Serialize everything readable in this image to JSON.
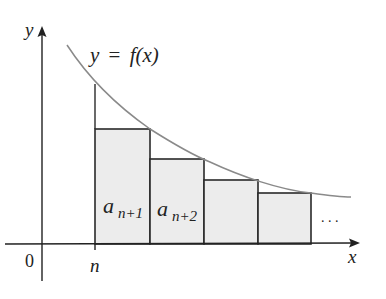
{
  "diagram": {
    "type": "riemann-rectangles-integral-test",
    "labels": {
      "y_axis": "y",
      "x_axis": "x",
      "origin": "0",
      "n_tick": "n",
      "curve_lhs": "y",
      "curve_eq": "=",
      "curve_rhs": "f(x)",
      "ellipsis": ". . ."
    },
    "rectangles": [
      {
        "label_base": "a",
        "label_sub": "n+1",
        "x0": 95,
        "x1": 150,
        "top": 129
      },
      {
        "label_base": "a",
        "label_sub": "n+2",
        "x0": 150,
        "x1": 204,
        "top": 159
      },
      {
        "label_base": "",
        "label_sub": "",
        "x0": 204,
        "x1": 258,
        "top": 180
      },
      {
        "label_base": "",
        "label_sub": "",
        "x0": 258,
        "x1": 311,
        "top": 193
      }
    ],
    "colors": {
      "axis": "#222222",
      "curve": "#8a8a8a",
      "rect_fill": "#ececec",
      "rect_stroke": "#2a2a2a"
    }
  }
}
